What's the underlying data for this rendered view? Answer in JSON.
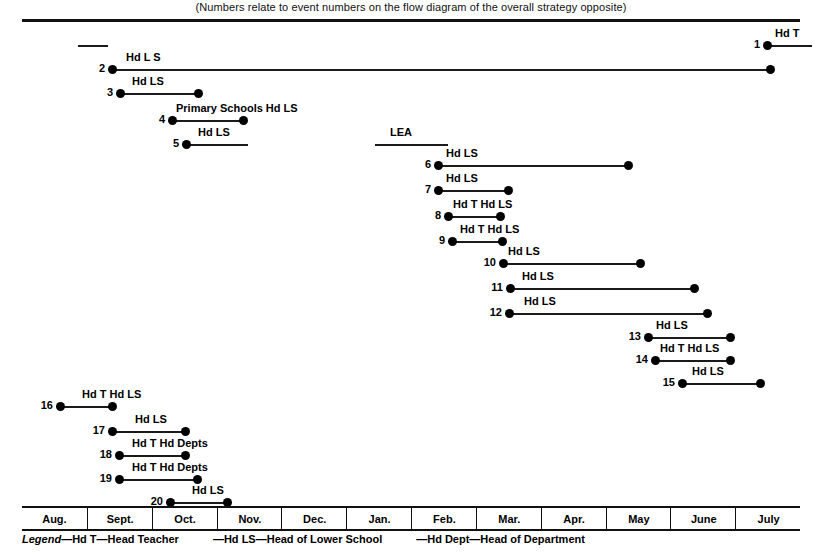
{
  "header": {
    "caption": "(Numbers relate to event numbers on the flow diagram of the overall strategy opposite)"
  },
  "axis": {
    "months": [
      "Aug.",
      "Sept.",
      "Oct.",
      "Nov.",
      "Dec.",
      "Jan.",
      "Feb.",
      "Mar.",
      "Apr.",
      "May",
      "June",
      "July"
    ]
  },
  "legend": {
    "title": "Legend",
    "dash": "—",
    "entries": [
      {
        "abbr": "Hd T",
        "meaning": "Head Teacher"
      },
      {
        "abbr": "Hd LS",
        "meaning": "Head of Lower School"
      },
      {
        "abbr": "Hd Dept",
        "meaning": "Head of Department"
      }
    ]
  },
  "chart_data": {
    "type": "gantt",
    "xlabel": "",
    "ylabel": "",
    "x_categories": [
      "Aug.",
      "Sept.",
      "Oct.",
      "Nov.",
      "Dec.",
      "Jan.",
      "Feb.",
      "Mar.",
      "Apr.",
      "May",
      "June",
      "July"
    ],
    "x_axis_px": {
      "left": 22,
      "right": 800
    },
    "grid": "vertical month dividers on axis strip only",
    "legend_position": "below-axis",
    "tasks": [
      {
        "id": "a",
        "number": "",
        "label": "",
        "start_px": 78,
        "end_px": 108,
        "row_y": 40,
        "label_x_px": 0,
        "start_dot": false,
        "end_dot": true,
        "label_align": "none"
      },
      {
        "id": "1",
        "number": "1",
        "label": "Hd T",
        "start_px": 767,
        "end_px": 812,
        "row_y": 40,
        "label_x_px": 775,
        "start_dot": true,
        "end_dot": false,
        "label_align": "left"
      },
      {
        "id": "2",
        "number": "2",
        "label": "Hd L  S",
        "start_px": 112,
        "end_px": 770,
        "row_y": 64,
        "label_x_px": 126,
        "start_dot": true,
        "end_dot": true,
        "label_align": "left"
      },
      {
        "id": "3",
        "number": "3",
        "label": "Hd  LS",
        "start_px": 120,
        "end_px": 198,
        "row_y": 88,
        "label_x_px": 132,
        "start_dot": true,
        "end_dot": true,
        "label_align": "left"
      },
      {
        "id": "4",
        "number": "4",
        "label": "Primary  Schools Hd  LS",
        "start_px": 172,
        "end_px": 243,
        "row_y": 115,
        "label_x_px": 176,
        "start_dot": true,
        "end_dot": true,
        "label_align": "left"
      },
      {
        "id": "b",
        "number": "",
        "label": "LEA",
        "start_px": 375,
        "end_px": 448,
        "row_y": 139,
        "label_x_px": 390,
        "start_dot": false,
        "end_dot": true,
        "label_align": "left"
      },
      {
        "id": "5",
        "number": "5",
        "label": "Hd  LS",
        "start_px": 186,
        "end_px": 248,
        "row_y": 139,
        "label_x_px": 198,
        "start_dot": true,
        "end_dot": false,
        "label_align": "left"
      },
      {
        "id": "6",
        "number": "6",
        "label": "Hd LS",
        "start_px": 438,
        "end_px": 628,
        "row_y": 160,
        "label_x_px": 446,
        "start_dot": true,
        "end_dot": true,
        "label_align": "left"
      },
      {
        "id": "7",
        "number": "7",
        "label": "Hd LS",
        "start_px": 438,
        "end_px": 508,
        "row_y": 185,
        "label_x_px": 446,
        "start_dot": true,
        "end_dot": true,
        "label_align": "left"
      },
      {
        "id": "8",
        "number": "8",
        "label": "Hd T  Hd LS",
        "start_px": 448,
        "end_px": 500,
        "row_y": 211,
        "label_x_px": 453,
        "start_dot": true,
        "end_dot": true,
        "label_align": "left"
      },
      {
        "id": "9",
        "number": "9",
        "label": "Hd T  Hd LS",
        "start_px": 452,
        "end_px": 502,
        "row_y": 236,
        "label_x_px": 460,
        "start_dot": true,
        "end_dot": true,
        "label_align": "left"
      },
      {
        "id": "10",
        "number": "10",
        "label": "Hd LS",
        "start_px": 503,
        "end_px": 640,
        "row_y": 258,
        "label_x_px": 508,
        "start_dot": true,
        "end_dot": true,
        "label_align": "left"
      },
      {
        "id": "11",
        "number": "11",
        "label": "Hd LS",
        "start_px": 510,
        "end_px": 694,
        "row_y": 283,
        "label_x_px": 522,
        "start_dot": true,
        "end_dot": true,
        "label_align": "left"
      },
      {
        "id": "12",
        "number": "12",
        "label": "Hd  LS",
        "start_px": 509,
        "end_px": 707,
        "row_y": 308,
        "label_x_px": 524,
        "start_dot": true,
        "end_dot": true,
        "label_align": "left"
      },
      {
        "id": "13",
        "number": "13",
        "label": "Hd  LS",
        "start_px": 648,
        "end_px": 730,
        "row_y": 332,
        "label_x_px": 656,
        "start_dot": true,
        "end_dot": true,
        "label_align": "left"
      },
      {
        "id": "14",
        "number": "14",
        "label": "Hd  T Hd LS",
        "start_px": 655,
        "end_px": 730,
        "row_y": 355,
        "label_x_px": 660,
        "start_dot": true,
        "end_dot": true,
        "label_align": "left"
      },
      {
        "id": "15",
        "number": "15",
        "label": "Hd LS",
        "start_px": 682,
        "end_px": 760,
        "row_y": 378,
        "label_x_px": 692,
        "start_dot": true,
        "end_dot": true,
        "label_align": "left"
      },
      {
        "id": "16",
        "number": "16",
        "label": "Hd T Hd LS",
        "start_px": 60,
        "end_px": 112,
        "row_y": 401,
        "label_x_px": 82,
        "start_dot": true,
        "end_dot": true,
        "label_align": "left"
      },
      {
        "id": "17",
        "number": "17",
        "label": "Hd  LS",
        "start_px": 112,
        "end_px": 185,
        "row_y": 426,
        "label_x_px": 135,
        "start_dot": true,
        "end_dot": true,
        "label_align": "left"
      },
      {
        "id": "18",
        "number": "18",
        "label": "Hd  T Hd Depts",
        "start_px": 119,
        "end_px": 185,
        "row_y": 450,
        "label_x_px": 132,
        "start_dot": true,
        "end_dot": true,
        "label_align": "left"
      },
      {
        "id": "19",
        "number": "19",
        "label": "Hd  T  Hd  Depts",
        "start_px": 119,
        "end_px": 197,
        "row_y": 474,
        "label_x_px": 132,
        "start_dot": true,
        "end_dot": true,
        "label_align": "left"
      },
      {
        "id": "20",
        "number": "20",
        "label": "Hd LS",
        "start_px": 170,
        "end_px": 227,
        "row_y": 497,
        "label_x_px": 192,
        "start_dot": true,
        "end_dot": true,
        "label_align": "left"
      }
    ]
  }
}
